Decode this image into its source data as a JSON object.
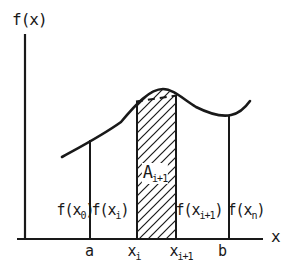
{
  "figure": {
    "background": "#ffffff",
    "ink": "#191919",
    "y_axis_label": "f(x)",
    "x_axis_label": "x",
    "area_label": {
      "main": "A",
      "sub": "i+1"
    },
    "function_labels": [
      {
        "pre": "f(x",
        "sub": "0",
        "post": ")"
      },
      {
        "pre": "f(x",
        "sub": "i",
        "post": ")"
      },
      {
        "pre": "f(x",
        "sub": "i+1",
        "post": ")"
      },
      {
        "pre": "f(x",
        "sub": "n",
        "post": ")"
      }
    ],
    "x_ticks": [
      {
        "main": "a",
        "sub": ""
      },
      {
        "main": "x",
        "sub": "i"
      },
      {
        "main": "x",
        "sub": "i+1"
      },
      {
        "main": "b",
        "sub": ""
      }
    ]
  }
}
